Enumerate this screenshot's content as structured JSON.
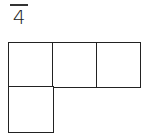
{
  "fraction": {
    "numerator": "1",
    "denominator": "4"
  },
  "grid": {
    "cells": [
      {
        "row": 0,
        "col": 0
      },
      {
        "row": 0,
        "col": 1
      },
      {
        "row": 0,
        "col": 2
      },
      {
        "row": 1,
        "col": 0
      }
    ],
    "cell_size_px": 45,
    "stroke_color": "#222222"
  }
}
